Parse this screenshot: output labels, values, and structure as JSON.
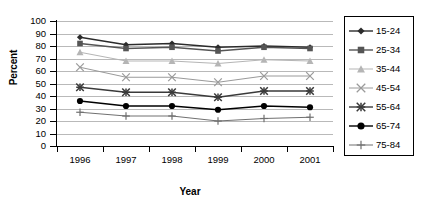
{
  "chart_data": {
    "type": "line",
    "title": "",
    "xlabel": "Year",
    "ylabel": "Percent",
    "categories": [
      "1996",
      "1997",
      "1998",
      "1999",
      "2000",
      "2001"
    ],
    "ylim": [
      0,
      100
    ],
    "yticks": [
      0,
      10,
      20,
      30,
      40,
      50,
      60,
      70,
      80,
      90,
      100
    ],
    "grid": true,
    "legend_position": "right",
    "series": [
      {
        "name": "15-24",
        "marker": "diamond",
        "color": "#2b2b2b",
        "values": [
          87,
          81,
          82,
          79,
          80,
          79
        ]
      },
      {
        "name": "25-34",
        "marker": "square",
        "color": "#555555",
        "values": [
          82,
          78,
          79,
          76,
          79,
          78
        ]
      },
      {
        "name": "35-44",
        "marker": "triangle",
        "color": "#b5b5b5",
        "values": [
          75,
          68,
          68,
          66,
          69,
          68
        ]
      },
      {
        "name": "45-54",
        "marker": "x",
        "color": "#9a9a9a",
        "values": [
          63,
          55,
          55,
          51,
          56,
          56
        ]
      },
      {
        "name": "55-64",
        "marker": "asterisk",
        "color": "#3a3a3a",
        "values": [
          47,
          43,
          43,
          39,
          44,
          44
        ]
      },
      {
        "name": "65-74",
        "marker": "circle",
        "color": "#000000",
        "values": [
          36,
          32,
          32,
          29,
          32,
          31
        ]
      },
      {
        "name": "75-84",
        "marker": "plus",
        "color": "#707070",
        "values": [
          27,
          24,
          24,
          20,
          22,
          23
        ]
      }
    ]
  },
  "legend": {
    "items": [
      {
        "label": "15-24"
      },
      {
        "label": "25-34"
      },
      {
        "label": "35-44"
      },
      {
        "label": "45-54"
      },
      {
        "label": "55-64"
      },
      {
        "label": "65-74"
      },
      {
        "label": "75-84"
      }
    ]
  }
}
